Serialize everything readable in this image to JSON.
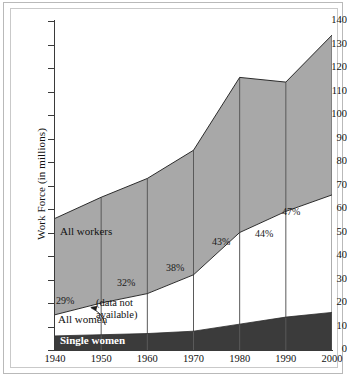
{
  "chart_data": {
    "type": "area",
    "title": "",
    "xlabel": "",
    "ylabel": "Work Force (in millions)",
    "x": [
      1940,
      1950,
      1960,
      1970,
      1980,
      1990,
      2000
    ],
    "xlim": [
      1940,
      2000
    ],
    "ylim": [
      0,
      140
    ],
    "ytick_step": 10,
    "grid": "vertical gridlines at each decade",
    "legend": "inline labels on bands",
    "series": [
      {
        "name": "All workers",
        "values": [
          56,
          65,
          73,
          85,
          116,
          114,
          134
        ]
      },
      {
        "name": "All women",
        "values": [
          15,
          20,
          24,
          32,
          50,
          59,
          66
        ]
      },
      {
        "name": "Single women",
        "values": [
          6,
          6.5,
          7,
          8,
          11,
          14,
          16
        ]
      }
    ],
    "annotations": [
      {
        "text": "29%",
        "x": 1940,
        "note": "women as share of all workers"
      },
      {
        "text": "32%",
        "x": 1955
      },
      {
        "text": "38%",
        "x": 1970
      },
      {
        "text": "43%",
        "x": 1980
      },
      {
        "text": "44%",
        "x": 1988
      },
      {
        "text": "47%",
        "x": 1996
      },
      {
        "text": "(data not available)",
        "x": 1950
      }
    ]
  },
  "axes": {
    "y_ticks": [
      "140",
      "130",
      "120",
      "110",
      "100",
      "90",
      "80",
      "70",
      "60",
      "50",
      "40",
      "30",
      "20",
      "10",
      "0"
    ],
    "y_title": "Work Force (in millions)",
    "x_ticks": [
      "1940",
      "1950",
      "1960",
      "1970",
      "1980",
      "1990",
      "2000"
    ]
  },
  "labels": {
    "all_workers": "All workers",
    "all_women": "All women",
    "single_women": "Single women",
    "data_not_available": "(data not available)",
    "pct_1940": "29%",
    "pct_1955": "32%",
    "pct_1970": "38%",
    "pct_1980": "43%",
    "pct_1988": "44%",
    "pct_1996": "47%"
  },
  "colors": {
    "all_workers_band": "#a8a8a8",
    "all_women_band": "#ffffff",
    "single_women_band": "#3b3b3b",
    "axis": "#3a3a3a",
    "gridline": "#5a5a5a",
    "outline": "#2b2b2b",
    "background": "#ffffff"
  }
}
